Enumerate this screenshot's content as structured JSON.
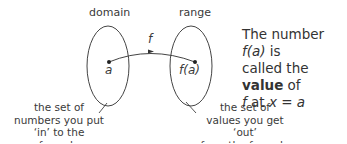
{
  "diagram": {
    "domain_label": "domain",
    "range_label": "range",
    "function_label": "f",
    "input_point_label": "a",
    "output_point_label": "f(a)",
    "domain_description": [
      "the set of",
      "numbers you put",
      "‘in’ to the formula"
    ],
    "range_description": [
      "the set of",
      "values you get ‘out’",
      "from the formula"
    ],
    "note": {
      "line1_prefix": "The number ",
      "line1_math": "f(a)",
      "line1_suffix": " is",
      "line2_prefix": "called the ",
      "line2_bold": "value",
      "line2_suffix": " of",
      "line3_f": "f",
      "line3_mid": " at ",
      "line3_math": "x = a"
    },
    "colors": {
      "stroke": "#444444",
      "text": "#333333"
    }
  }
}
